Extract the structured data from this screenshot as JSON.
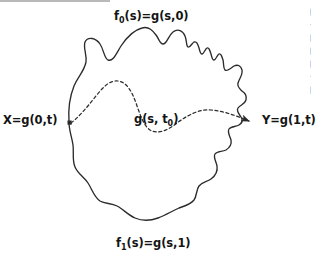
{
  "figure": {
    "background_color": "#ffffff",
    "stroke_color": "#2b2b2b",
    "rule_color": "#b9b9b9",
    "labels": {
      "top": {
        "base": "f",
        "sub": "0",
        "rest": "(s)=g(s,0)"
      },
      "bottom": {
        "base": "f",
        "sub": "1",
        "rest": "(s)=g(s,1)"
      },
      "left": "X=g(0,t)",
      "right": "Y=g(1,t)",
      "inner": {
        "base": "g(s, t",
        "sub": "0",
        "rest": ")"
      }
    },
    "curves": {
      "outer": {
        "name": "outer-boundary-curve",
        "style": "solid",
        "closed": true,
        "path": "M 69,122 C 68,108 70,96 74,86 C 78,76 84,72 86,62 C 87,54 83,48 85,42 C 88,36 96,38 100,44 C 104,50 104,58 108,60 C 113,62 116,54 121,46 C 127,37 134,30 142,28 C 149,26 153,31 156,35 C 159,39 160,44 163,44 C 167,44 168,36 173,32 C 178,28 183,31 185,36 C 187,41 186,46 188,47 C 190,48 192,43 194,42 C 197,41 198,45 199,48 C 200,51 200,54 202,54 C 204,54 205,49 207,48 C 209,47 210,51 211,54 C 212,57 212,60 214,60 C 216,60 217,55 219,54 C 221,53 222,57 223,60 C 224,64 223,68 225,70 C 227,72 231,68 234,66 C 238,64 241,66 242,70 C 243,75 239,79 238,83 C 237,87 240,89 242,91 C 245,93 247,96 246,100 C 245,104 240,105 238,108 C 236,111 239,114 241,117 C 243,120 242,123 239,125 C 236,127 231,126 229,129 C 227,132 230,136 231,140 C 232,145 229,148 226,150 C 222,152 217,151 215,154 C 213,157 216,161 217,166 C 218,172 215,176 211,179 C 207,182 202,182 199,186 C 196,190 197,196 194,200 C 190,205 184,206 179,208 C 172,211 166,215 158,218 C 150,221 142,221 135,218 C 128,215 123,209 117,206 C 111,203 105,204 100,201 C 94,197 92,189 88,183 C 84,177 78,174 75,167 C 72,160 74,152 73,145 C 72,137 69,131 69,122 Z"
      },
      "inner": {
        "name": "homotopy-level-curve",
        "style": "dashed",
        "dash_pattern": "3,2.6",
        "path": "M 71,123 C 80,116 88,106 96,96 C 103,87 110,80 118,81 C 127,82 132,92 136,103 C 140,114 143,125 150,130 C 158,135 168,130 177,123 C 188,115 199,109 211,110 C 224,111 237,116 249,121"
      }
    },
    "markers": {
      "start_point": {
        "name": "x-endpoint-marker",
        "shape": "square",
        "x": 70,
        "y": 123
      },
      "end_arrow": {
        "name": "y-arrowhead",
        "shape": "arrow",
        "x": 255,
        "y": 122
      }
    },
    "edge_fragments": [
      "|",
      "·",
      "|",
      "|",
      "|",
      "·",
      "|"
    ]
  }
}
